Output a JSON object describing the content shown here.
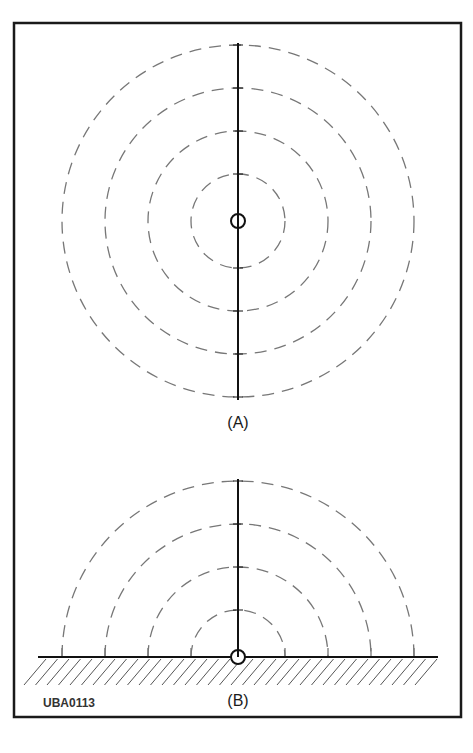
{
  "figure": {
    "frame": {
      "x": 14,
      "y": 23,
      "width": 447,
      "height": 694
    },
    "colors": {
      "frame": "#1a1a1a",
      "rod": "#111111",
      "dashed": "#777777",
      "hatch": "#555555"
    },
    "panel_a": {
      "label": "(A)",
      "description": "Full-sphere radiation: vertical element in free space with concentric dashed circles",
      "center": {
        "x": 238,
        "y": 221
      },
      "radii": [
        47,
        90,
        133,
        176
      ],
      "rod": {
        "top": 43,
        "bottom": 400
      },
      "source_circle_radius": 7
    },
    "panel_b": {
      "label": "(B)",
      "description": "Half-sphere radiation: vertical element on hatched ground plane with concentric dashed semicircles",
      "center": {
        "x": 238,
        "y": 657
      },
      "radii": [
        47,
        90,
        133,
        176
      ],
      "rod": {
        "top": 479,
        "bottom": 657
      },
      "ground": {
        "x1": 38,
        "x2": 438,
        "y": 657
      },
      "source_circle_radius": 7
    },
    "code": "UBA0113"
  }
}
